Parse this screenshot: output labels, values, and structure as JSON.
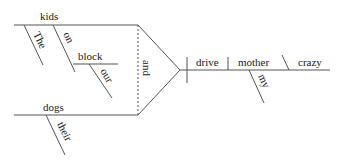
{
  "diagram": {
    "type": "reed-kellogg-sentence-diagram",
    "subjects": [
      {
        "word": "kids",
        "modifiers": [
          "The",
          "on"
        ],
        "prepositional_object": {
          "word": "block",
          "modifiers": [
            "our"
          ]
        }
      },
      {
        "word": "dogs",
        "modifiers": [
          "their"
        ]
      }
    ],
    "conjunction": "and",
    "predicate": {
      "verb": "drive",
      "direct_object": {
        "word": "mother",
        "modifiers": [
          "my"
        ]
      },
      "object_complement": "crazy"
    },
    "line_color": "#555555",
    "text_color": "#1a1a1a"
  }
}
